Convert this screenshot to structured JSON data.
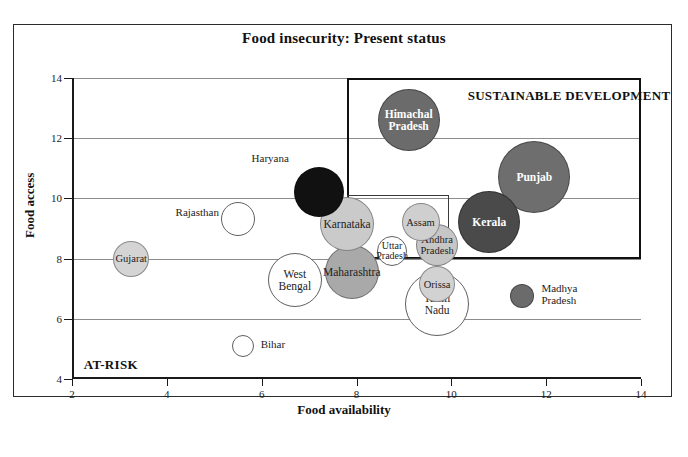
{
  "figure": {
    "title": "Food insecurity: Present status",
    "caption": ""
  },
  "chart_data": {
    "type": "scatter",
    "title": "Food insecurity: Present status",
    "xlabel": "Food availability",
    "ylabel": "Food access",
    "xlim": [
      2,
      14
    ],
    "ylim": [
      4,
      14
    ],
    "xticks": [
      2,
      4,
      6,
      8,
      10,
      12,
      14
    ],
    "yticks": [
      4,
      6,
      8,
      10,
      12,
      14
    ],
    "grid": "horizontal",
    "legend": "none",
    "bubble_encoding": "size = relative magnitude; shade = category",
    "annotations": [
      {
        "text": "SUSTAINABLE DEVELOPMENT",
        "x": 12.2,
        "y": 13.4
      },
      {
        "text": "AT-RISK",
        "x": 2.5,
        "y": 4.45
      }
    ],
    "zones": [
      {
        "name": "sustainable-development",
        "x0": 7.8,
        "y0": 8.0,
        "x1": 14.0,
        "y1": 14.0
      },
      {
        "name": "inner-threshold",
        "x0": 7.8,
        "y0": 8.0,
        "x1": 9.95,
        "y1": 10.1
      }
    ],
    "points": [
      {
        "label": "Himachal Pradesh",
        "x": 9.1,
        "y": 12.6,
        "size": 31,
        "shade": "#6b6b6b",
        "text": "inside",
        "text_color": "#ffffff"
      },
      {
        "label": "Haryana",
        "x": 7.2,
        "y": 10.2,
        "size": 25,
        "shade": "#111111",
        "text": "outside-top-left",
        "text_color": "#1d1d1d"
      },
      {
        "label": "Punjab",
        "x": 11.75,
        "y": 10.7,
        "size": 36,
        "shade": "#6e6e6e",
        "text": "inside",
        "text_color": "#ffffff"
      },
      {
        "label": "Kerala",
        "x": 10.8,
        "y": 9.2,
        "size": 31,
        "shade": "#4a4a4a",
        "text": "inside",
        "text_color": "#ffffff"
      },
      {
        "label": "Karnataka",
        "x": 7.8,
        "y": 9.15,
        "size": 27,
        "shade": "#cacaca",
        "text": "inside",
        "text_color": "#1d1d1d"
      },
      {
        "label": "Assam",
        "x": 9.35,
        "y": 9.2,
        "size": 19,
        "shade": "#cfcfcf",
        "text": "inside",
        "text_color": "#1d1d1d"
      },
      {
        "label": "Andhra Pradesh",
        "x": 9.7,
        "y": 8.45,
        "size": 21,
        "shade": "#c6c6c6",
        "text": "inside",
        "text_color": "#1d1d1d"
      },
      {
        "label": "Uttar Pradesh",
        "x": 8.75,
        "y": 8.25,
        "size": 15,
        "shade": "#ffffff",
        "text": "inside",
        "text_color": "#1d1d1d"
      },
      {
        "label": "Maharashtra",
        "x": 7.9,
        "y": 7.55,
        "size": 27,
        "shade": "#a9a9a9",
        "text": "inside",
        "text_color": "#1d1d1d"
      },
      {
        "label": "West Bengal",
        "x": 6.7,
        "y": 7.3,
        "size": 27,
        "shade": "#ffffff",
        "text": "inside",
        "text_color": "#1d1d1d"
      },
      {
        "label": "Orissa",
        "x": 9.7,
        "y": 7.15,
        "size": 18,
        "shade": "#d2d2d2",
        "text": "inside",
        "text_color": "#1d1d1d"
      },
      {
        "label": "Tamil Nadu",
        "x": 9.7,
        "y": 6.5,
        "size": 32,
        "shade": "#ffffff",
        "text": "inside",
        "text_color": "#1d1d1d"
      },
      {
        "label": "Gujarat",
        "x": 3.25,
        "y": 8.0,
        "size": 18,
        "shade": "#d4d4d4",
        "text": "inside",
        "text_color": "#1d1d1d"
      },
      {
        "label": "Rajasthan",
        "x": 5.5,
        "y": 9.3,
        "size": 17,
        "shade": "#ffffff",
        "text": "outside-left",
        "text_color": "#1d1d1d"
      },
      {
        "label": "Bihar",
        "x": 5.6,
        "y": 5.1,
        "size": 11,
        "shade": "#ffffff",
        "text": "outside-right",
        "text_color": "#1d1d1d"
      },
      {
        "label": "Madhya Pradesh",
        "x": 11.5,
        "y": 6.75,
        "size": 12,
        "shade": "#6b6b6b",
        "text": "outside-right",
        "text_color": "#1d1d1d"
      }
    ]
  },
  "axes": {
    "y_title": "Food access",
    "x_title": "Food availability",
    "y_ticks": [
      "4",
      "6",
      "8",
      "10",
      "12",
      "14"
    ],
    "x_ticks": [
      "2",
      "4",
      "6",
      "8",
      "10",
      "12",
      "14"
    ]
  },
  "zone_labels": {
    "sustainable": "SUSTAINABLE DEVELOPMENT",
    "at_risk": "AT-RISK"
  },
  "bubbles": {
    "himachal": "Himachal\nPradesh",
    "haryana": "Haryana",
    "punjab": "Punjab",
    "kerala": "Kerala",
    "karnataka": "Karnataka",
    "assam": "Assam",
    "andhra": "Andhra\nPradesh",
    "uttar": "Uttar\nPradesh",
    "maharashtra": "Maharashtra",
    "westbengal": "West\nBengal",
    "orissa": "Orissa",
    "tamilnadu": "Tamil\nNadu",
    "gujarat": "Gujarat",
    "rajasthan": "Rajasthan",
    "bihar": "Bihar",
    "madhya": "Madhya\nPradesh"
  }
}
